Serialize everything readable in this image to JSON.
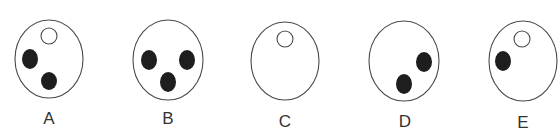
{
  "figures": [
    {
      "label": "A",
      "outer": {
        "cx": 49,
        "cy": 59,
        "rx": 34,
        "ry": 39
      },
      "open_circles": [
        {
          "cx": 49,
          "cy": 36,
          "r": 8
        }
      ],
      "filled_dots": [
        {
          "cx": 30,
          "cy": 59,
          "rx": 8,
          "ry": 10
        },
        {
          "cx": 49,
          "cy": 81,
          "rx": 8,
          "ry": 9
        }
      ],
      "label_pos": {
        "x": 49,
        "y": 124
      }
    },
    {
      "label": "B",
      "outer": {
        "cx": 168,
        "cy": 60,
        "rx": 35,
        "ry": 40
      },
      "open_circles": [],
      "filled_dots": [
        {
          "cx": 149,
          "cy": 60,
          "rx": 8,
          "ry": 10
        },
        {
          "cx": 187,
          "cy": 60,
          "rx": 8,
          "ry": 10
        },
        {
          "cx": 168,
          "cy": 82,
          "rx": 8,
          "ry": 10
        }
      ],
      "label_pos": {
        "x": 168,
        "y": 124
      }
    },
    {
      "label": "C",
      "outer": {
        "cx": 285,
        "cy": 61,
        "rx": 34,
        "ry": 39
      },
      "open_circles": [
        {
          "cx": 285,
          "cy": 39,
          "r": 8
        }
      ],
      "filled_dots": [],
      "label_pos": {
        "x": 285,
        "y": 127
      }
    },
    {
      "label": "D",
      "outer": {
        "cx": 404,
        "cy": 61,
        "rx": 35,
        "ry": 40
      },
      "open_circles": [],
      "filled_dots": [
        {
          "cx": 424,
          "cy": 62,
          "rx": 8,
          "ry": 10
        },
        {
          "cx": 404,
          "cy": 84,
          "rx": 8,
          "ry": 10
        }
      ],
      "label_pos": {
        "x": 405,
        "y": 127
      }
    },
    {
      "label": "E",
      "outer": {
        "cx": 523,
        "cy": 61,
        "rx": 34,
        "ry": 40
      },
      "open_circles": [
        {
          "cx": 522,
          "cy": 39,
          "r": 8
        }
      ],
      "filled_dots": [
        {
          "cx": 503,
          "cy": 61,
          "rx": 8,
          "ry": 10
        }
      ],
      "label_pos": {
        "x": 523,
        "y": 128
      }
    }
  ]
}
